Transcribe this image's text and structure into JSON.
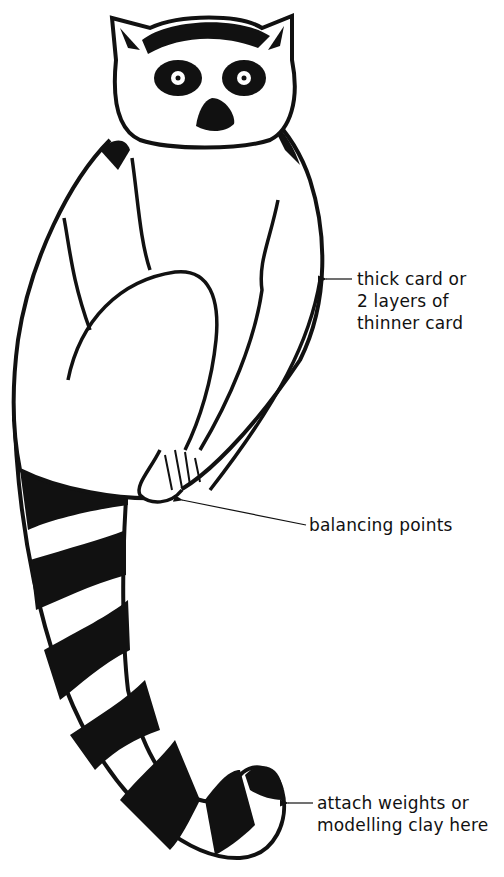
{
  "diagram": {
    "colors": {
      "ink": "#111111",
      "paper": "#ffffff"
    },
    "annotations": [
      {
        "id": "card",
        "lines": [
          "thick card or",
          "2 layers of",
          "thinner card"
        ],
        "points_to": "body"
      },
      {
        "id": "balance",
        "lines": [
          "balancing points"
        ],
        "points_to": "feet"
      },
      {
        "id": "weights",
        "lines": [
          "attach weights or",
          "modelling clay here"
        ],
        "points_to": "tail-tip"
      }
    ]
  }
}
